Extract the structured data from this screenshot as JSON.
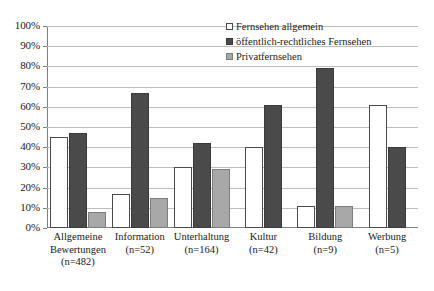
{
  "chart_data": {
    "type": "bar",
    "title": "",
    "xlabel": "",
    "ylabel": "",
    "ylim": [
      0,
      100
    ],
    "grid": true,
    "legend_position": "top-right-inside",
    "categories": [
      "Allgemeine Bewertungen (n=482)",
      "Information (n=52)",
      "Unterhaltung (n=164)",
      "Kultur (n=42)",
      "Bildung (n=9)",
      "Werbung (n=5)"
    ],
    "category_lines": [
      [
        "Allgemeine",
        "Bewertungen",
        "(n=482)"
      ],
      [
        "Information",
        "(n=52)"
      ],
      [
        "Unterhaltung",
        "(n=164)"
      ],
      [
        "Kultur",
        "(n=42)"
      ],
      [
        "Bildung",
        "(n=9)"
      ],
      [
        "Werbung",
        "(n=5)"
      ]
    ],
    "ticks": [
      "0%",
      "10%",
      "20%",
      "30%",
      "40%",
      "50%",
      "60%",
      "70%",
      "80%",
      "90%",
      "100%"
    ],
    "tick_values": [
      0,
      10,
      20,
      30,
      40,
      50,
      60,
      70,
      80,
      90,
      100
    ],
    "series": [
      {
        "name": "Fernsehen allgemein",
        "key": "series-general",
        "color": "#ffffff",
        "values": [
          45,
          17,
          30,
          40,
          11,
          61
        ]
      },
      {
        "name": "öffentlich-rechtliches Fernsehen",
        "key": "series-public",
        "color": "#4a4a4a",
        "values": [
          47,
          67,
          42,
          61,
          79,
          40
        ]
      },
      {
        "name": "Privatfernsehen",
        "key": "series-private",
        "color": "#a8a8a8",
        "values": [
          8,
          15,
          29,
          null,
          11,
          null
        ]
      }
    ]
  }
}
